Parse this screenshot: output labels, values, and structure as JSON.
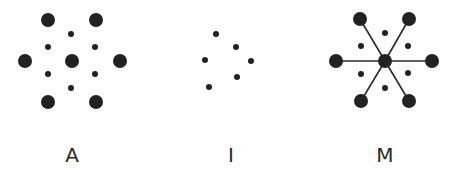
{
  "colors": {
    "dot": "#222222",
    "line": "#2a2a2a",
    "background": "#ffffff"
  },
  "sizes": {
    "large_r": 7,
    "small_r": 3
  },
  "panels": [
    {
      "label": "A",
      "label_pos": [
        72,
        162
      ],
      "dots": [
        {
          "x": 48,
          "y": 20,
          "size": "large"
        },
        {
          "x": 96,
          "y": 20,
          "size": "large"
        },
        {
          "x": 71,
          "y": 34,
          "size": "small"
        },
        {
          "x": 48,
          "y": 47,
          "size": "small"
        },
        {
          "x": 95,
          "y": 47,
          "size": "small"
        },
        {
          "x": 25,
          "y": 61,
          "size": "large"
        },
        {
          "x": 72,
          "y": 61,
          "size": "large"
        },
        {
          "x": 120,
          "y": 61,
          "size": "large"
        },
        {
          "x": 48,
          "y": 74,
          "size": "small"
        },
        {
          "x": 95,
          "y": 74,
          "size": "small"
        },
        {
          "x": 71,
          "y": 88,
          "size": "small"
        },
        {
          "x": 48,
          "y": 102,
          "size": "large"
        },
        {
          "x": 96,
          "y": 102,
          "size": "large"
        }
      ],
      "bonds": []
    },
    {
      "label": "I",
      "label_pos": [
        231,
        162
      ],
      "dots": [
        {
          "x": 216,
          "y": 34,
          "size": "small"
        },
        {
          "x": 236,
          "y": 47,
          "size": "small"
        },
        {
          "x": 205,
          "y": 60,
          "size": "small"
        },
        {
          "x": 251,
          "y": 61,
          "size": "small"
        },
        {
          "x": 237,
          "y": 77,
          "size": "small"
        },
        {
          "x": 209,
          "y": 87,
          "size": "small"
        }
      ],
      "bonds": []
    },
    {
      "label": "M",
      "label_pos": [
        385,
        162
      ],
      "dots": [
        {
          "x": 360,
          "y": 19,
          "size": "large"
        },
        {
          "x": 409,
          "y": 19,
          "size": "large"
        },
        {
          "x": 385,
          "y": 33,
          "size": "small"
        },
        {
          "x": 361,
          "y": 46,
          "size": "small"
        },
        {
          "x": 408,
          "y": 46,
          "size": "small"
        },
        {
          "x": 336,
          "y": 61,
          "size": "large"
        },
        {
          "x": 385,
          "y": 61,
          "size": "large"
        },
        {
          "x": 432,
          "y": 61,
          "size": "large"
        },
        {
          "x": 361,
          "y": 74,
          "size": "small"
        },
        {
          "x": 408,
          "y": 73,
          "size": "small"
        },
        {
          "x": 385,
          "y": 88,
          "size": "small"
        },
        {
          "x": 361,
          "y": 101,
          "size": "large"
        },
        {
          "x": 409,
          "y": 101,
          "size": "large"
        }
      ],
      "bonds": [
        {
          "from": [
            385,
            61
          ],
          "to": [
            360,
            19
          ]
        },
        {
          "from": [
            385,
            61
          ],
          "to": [
            409,
            19
          ]
        },
        {
          "from": [
            385,
            61
          ],
          "to": [
            336,
            61
          ]
        },
        {
          "from": [
            385,
            61
          ],
          "to": [
            432,
            61
          ]
        },
        {
          "from": [
            385,
            61
          ],
          "to": [
            361,
            101
          ]
        },
        {
          "from": [
            385,
            61
          ],
          "to": [
            409,
            101
          ]
        }
      ]
    }
  ]
}
